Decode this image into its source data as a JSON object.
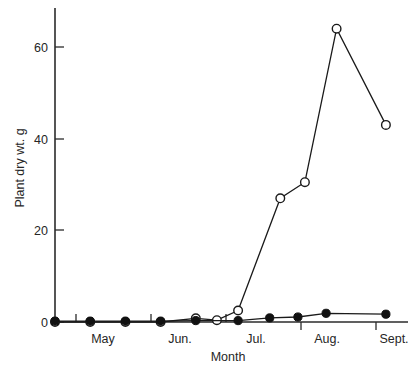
{
  "chart_data": {
    "type": "line",
    "title": "",
    "xlabel": "Month",
    "ylabel": "Plant dry wt. g",
    "ylim": [
      0,
      68
    ],
    "yticks": [
      0,
      20,
      40,
      60
    ],
    "ytick_labels": [
      "0",
      "20",
      "40",
      "60"
    ],
    "xtick_labels": [
      "May",
      "Jun.",
      "Jul.",
      "Aug.",
      "Sept."
    ],
    "grid": false,
    "legend": "none",
    "x_unit": "sampling date",
    "series": [
      {
        "name": "open-circle-series",
        "marker": "open-circle",
        "x": [
          0.0,
          1.0,
          2.0,
          3.0,
          4.0,
          4.6,
          5.2,
          6.4,
          7.1,
          8.0,
          9.4
        ],
        "values": [
          0.0,
          0.0,
          0.0,
          0.0,
          0.8,
          0.4,
          2.5,
          27.0,
          30.5,
          64.0,
          43.0
        ]
      },
      {
        "name": "filled-circle-series",
        "marker": "filled-circle",
        "x": [
          0.0,
          1.0,
          2.0,
          3.0,
          4.0,
          5.2,
          6.1,
          6.9,
          7.7,
          9.4
        ],
        "values": [
          0.2,
          0.2,
          0.2,
          0.2,
          0.3,
          0.3,
          0.9,
          1.1,
          1.9,
          1.7
        ]
      }
    ]
  },
  "caption": {
    "line": ""
  }
}
